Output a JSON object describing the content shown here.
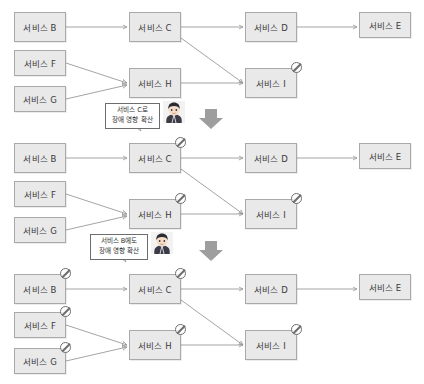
{
  "diagram": {
    "type": "service-dependency-failure-propagation",
    "colors": {
      "node_fill": "#e9e9e9",
      "node_border": "#a9a9a9",
      "link": "#9a9a9a",
      "ban": "#6e6e6e",
      "bubble_border": "#6d6d6d",
      "arrow": "#9e9e9e",
      "text": "#3a3a3a"
    },
    "panels": [
      {
        "id": "panel-1",
        "stage": 1,
        "nodes": [
          {
            "id": "b1",
            "label": "서비스 B",
            "blocked": false
          },
          {
            "id": "f1",
            "label": "서비스 F",
            "blocked": false
          },
          {
            "id": "g1",
            "label": "서비스 G",
            "blocked": false
          },
          {
            "id": "c1",
            "label": "서비스 C",
            "blocked": false
          },
          {
            "id": "h1",
            "label": "서비스 H",
            "blocked": false
          },
          {
            "id": "d1",
            "label": "서비스 D",
            "blocked": false
          },
          {
            "id": "i1",
            "label": "서비스 I",
            "blocked": true
          },
          {
            "id": "e1",
            "label": "서비스 E",
            "blocked": false
          }
        ],
        "edges": [
          {
            "from": "b1",
            "to": "c1"
          },
          {
            "from": "c1",
            "to": "d1"
          },
          {
            "from": "d1",
            "to": "e1"
          },
          {
            "from": "c1",
            "to": "i1"
          },
          {
            "from": "f1",
            "to": "h1"
          },
          {
            "from": "g1",
            "to": "h1"
          },
          {
            "from": "h1",
            "to": "i1"
          }
        ],
        "blocked_nodes": [
          "서비스 I"
        ]
      },
      {
        "id": "panel-2",
        "stage": 2,
        "nodes": [
          {
            "id": "b2",
            "label": "서비스 B",
            "blocked": false
          },
          {
            "id": "f2",
            "label": "서비스 F",
            "blocked": false
          },
          {
            "id": "g2",
            "label": "서비스 G",
            "blocked": false
          },
          {
            "id": "c2",
            "label": "서비스 C",
            "blocked": true
          },
          {
            "id": "h2",
            "label": "서비스 H",
            "blocked": true
          },
          {
            "id": "d2",
            "label": "서비스 D",
            "blocked": false
          },
          {
            "id": "i2",
            "label": "서비스 I",
            "blocked": true
          },
          {
            "id": "e2",
            "label": "서비스 E",
            "blocked": false
          }
        ],
        "edges": [
          {
            "from": "b2",
            "to": "c2"
          },
          {
            "from": "c2",
            "to": "d2"
          },
          {
            "from": "d2",
            "to": "e2"
          },
          {
            "from": "c2",
            "to": "i2"
          },
          {
            "from": "f2",
            "to": "h2"
          },
          {
            "from": "g2",
            "to": "h2"
          },
          {
            "from": "h2",
            "to": "i2"
          }
        ],
        "blocked_nodes": [
          "서비스 C",
          "서비스 H",
          "서비스 I"
        ]
      },
      {
        "id": "panel-3",
        "stage": 3,
        "nodes": [
          {
            "id": "b3",
            "label": "서비스 B",
            "blocked": true
          },
          {
            "id": "f3",
            "label": "서비스 F",
            "blocked": true
          },
          {
            "id": "g3",
            "label": "서비스 G",
            "blocked": true
          },
          {
            "id": "c3",
            "label": "서비스 C",
            "blocked": true
          },
          {
            "id": "h3",
            "label": "서비스 H",
            "blocked": true
          },
          {
            "id": "d3",
            "label": "서비스 D",
            "blocked": false
          },
          {
            "id": "i3",
            "label": "서비스 I",
            "blocked": true
          },
          {
            "id": "e3",
            "label": "서비스 E",
            "blocked": false
          }
        ],
        "edges": [
          {
            "from": "b3",
            "to": "c3"
          },
          {
            "from": "c3",
            "to": "d3"
          },
          {
            "from": "d3",
            "to": "e3"
          },
          {
            "from": "c3",
            "to": "i3"
          },
          {
            "from": "f3",
            "to": "h3"
          },
          {
            "from": "g3",
            "to": "h3"
          },
          {
            "from": "h3",
            "to": "i3"
          }
        ],
        "blocked_nodes": [
          "서비스 B",
          "서비스 F",
          "서비스 G",
          "서비스 C",
          "서비스 H",
          "서비스 I"
        ]
      }
    ],
    "callouts": [
      {
        "id": "callout-1",
        "line1": "서비스 C로",
        "line2": "장애 영향 확산"
      },
      {
        "id": "callout-2",
        "line1": "서비스 B에도",
        "line2": "장애 영향 확산"
      }
    ],
    "icons": {
      "blocked": "prohibited-icon",
      "person": "person-avatar-icon",
      "transition": "down-arrow-icon"
    }
  }
}
